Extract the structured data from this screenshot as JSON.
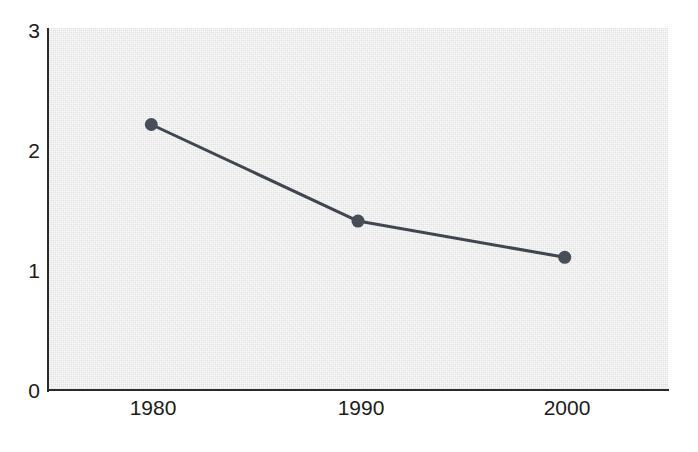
{
  "chart_data": {
    "type": "line",
    "title": "",
    "subtitle": "",
    "xlabel": "",
    "ylabel": "",
    "categories": [
      "1980",
      "1990",
      "2000"
    ],
    "x": [
      1980,
      1990,
      2000
    ],
    "values": [
      2.2,
      1.4,
      1.1
    ],
    "series": [
      {
        "name": "",
        "values": [
          2.2,
          1.4,
          1.1
        ]
      }
    ],
    "xlim": [
      1975,
      2005
    ],
    "ylim": [
      0,
      3
    ],
    "ytick_labels": [
      "0",
      "1",
      "2",
      "3"
    ],
    "ytick_values": [
      0,
      1,
      2,
      3
    ],
    "xtick_labels": [
      "1980",
      "1990",
      "2000"
    ],
    "xtick_values": [
      1980,
      1990,
      2000
    ],
    "grid": false,
    "legend": null,
    "legend_position": "none",
    "annotations": [],
    "marker": "circle",
    "colors": {
      "line": "#3f4650",
      "marker": "#474e58",
      "panel_background": "#e4e4e4",
      "axis": "#2b2b2b",
      "tick_label": "#1b1b1b",
      "figure_background": "#ffffff"
    }
  },
  "axes": {
    "y": {
      "ticks": [
        {
          "label": "3",
          "value": 3
        },
        {
          "label": "2",
          "value": 2
        },
        {
          "label": "1",
          "value": 1
        },
        {
          "label": "0",
          "value": 0
        }
      ]
    },
    "x": {
      "ticks": [
        {
          "label": "1980",
          "value": 1980
        },
        {
          "label": "1990",
          "value": 1990
        },
        {
          "label": "2000",
          "value": 2000
        }
      ]
    }
  },
  "points": [
    {
      "x_label": "1980",
      "y_value": "2.2"
    },
    {
      "x_label": "1990",
      "y_value": "1.4"
    },
    {
      "x_label": "2000",
      "y_value": "1.1"
    }
  ]
}
